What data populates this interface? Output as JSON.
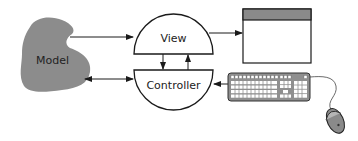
{
  "diagram": {
    "nodes": {
      "model": {
        "label": "Model"
      },
      "view": {
        "label": "View"
      },
      "controller": {
        "label": "Controller"
      },
      "display": {
        "label": ""
      },
      "keyboard": {
        "label": ""
      },
      "mouse": {
        "label": ""
      }
    },
    "edges": [
      {
        "from": "model",
        "to": "view",
        "type": "directed"
      },
      {
        "from": "model",
        "to": "controller",
        "type": "bidirectional"
      },
      {
        "from": "view",
        "to": "controller",
        "type": "directed"
      },
      {
        "from": "controller",
        "to": "view",
        "type": "directed"
      },
      {
        "from": "view",
        "to": "display",
        "type": "directed"
      },
      {
        "from": "keyboard",
        "to": "controller",
        "type": "directed"
      }
    ],
    "colors": {
      "model_fill": "#8c8c8c",
      "stroke": "#1a1a1a",
      "titlebar": "#8a8a8a",
      "keyboard_body": "#8f8f8f",
      "mouse_body": "#8a8a8a"
    }
  }
}
